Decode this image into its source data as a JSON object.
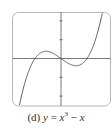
{
  "chart_data": {
    "type": "line",
    "title": "",
    "caption_label": "(d)",
    "equation": "y = x^3 - x",
    "xlabel": "",
    "ylabel": "",
    "xlim": [
      -1.9,
      1.9
    ],
    "ylim": [
      -2.5,
      2.5
    ],
    "grid": false,
    "legend": null,
    "x_ticks": [],
    "y_ticks": [
      -2,
      -1,
      1,
      2
    ],
    "series": [
      {
        "name": "y = x^3 - x",
        "function": "x^3 - x",
        "x": [
          -1.6,
          -1.4,
          -1.2,
          -1.0,
          -0.8,
          -0.577,
          -0.4,
          -0.2,
          0.0,
          0.2,
          0.4,
          0.577,
          0.8,
          1.0,
          1.2,
          1.4,
          1.6
        ],
        "values": [
          -2.496,
          -1.344,
          -0.528,
          0.0,
          0.288,
          0.385,
          0.336,
          0.192,
          0.0,
          -0.192,
          -0.336,
          -0.385,
          -0.288,
          0.0,
          0.528,
          1.344,
          2.496
        ],
        "color": "#555555"
      }
    ],
    "colors": {
      "frame": "#b0b0b0",
      "axes": "#555555",
      "curve": "#555555"
    }
  },
  "caption": {
    "label": "(d)",
    "lhs": "y",
    "eq": " = ",
    "base": "x",
    "exp": "3",
    "rest": " − ",
    "var2": "x"
  }
}
